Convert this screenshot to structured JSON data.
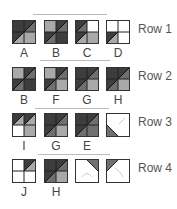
{
  "colors": {
    "dark": "#3d3d3d",
    "mid": "#6f6f6f",
    "light": "#a9a9a9",
    "white": "#ffffff",
    "border": "#333333"
  },
  "rows": [
    {
      "label": "Row 1",
      "tiles": [
        {
          "label": "A",
          "q": [
            "dark",
            "dark/mid",
            "dark/light",
            "light"
          ]
        },
        {
          "label": "B",
          "q": [
            "light",
            "dark/mid",
            "dark/mid",
            "dark"
          ]
        },
        {
          "label": "C",
          "q": [
            "dark/mid",
            "white",
            "dark/light",
            "light"
          ]
        },
        {
          "label": "D",
          "q": [
            "white",
            "white",
            "dark/light",
            "white"
          ]
        }
      ]
    },
    {
      "label": "Row 2",
      "tiles": [
        {
          "label": "B",
          "q": [
            "light",
            "dark/mid",
            "dark/mid",
            "dark"
          ]
        },
        {
          "label": "F",
          "q": [
            "light",
            "dark/mid",
            "dark/mid",
            "light"
          ]
        },
        {
          "label": "G",
          "q": [
            "dark",
            "dark/mid",
            "dark/mid",
            "light"
          ]
        },
        {
          "label": "H",
          "q": [
            "dark",
            "dark/mid",
            "dark/mid",
            "light"
          ]
        }
      ]
    },
    {
      "label": "Row 3",
      "tiles": [
        {
          "label": "I",
          "q": [
            "dark/light",
            "dark/light",
            "white",
            "light"
          ]
        },
        {
          "label": "G",
          "q": [
            "dark",
            "dark/mid",
            "dark/mid",
            "light"
          ]
        },
        {
          "label": "E",
          "q": [
            "dark",
            "dark/mid",
            "dark/mid",
            "mid"
          ]
        },
        {
          "label": "",
          "q": [
            "corner-bl"
          ]
        }
      ]
    },
    {
      "label": "Row 4",
      "tiles": [
        {
          "label": "J",
          "q": [
            "white",
            "dark/light",
            "white",
            "white"
          ]
        },
        {
          "label": "H",
          "q": [
            "dark",
            "dark/mid",
            "dark/mid",
            "light"
          ]
        },
        {
          "label": "",
          "q": [
            "corner-tr"
          ]
        },
        {
          "label": "",
          "q": [
            "corner-tl"
          ]
        }
      ]
    }
  ]
}
